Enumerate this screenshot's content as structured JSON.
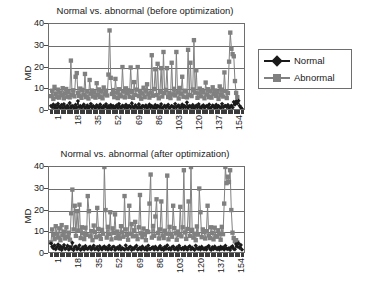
{
  "figure": {
    "background": "#ffffff",
    "axis_color": "#6e6e6e"
  },
  "legend": {
    "normal_label": "Normal",
    "abnormal_label": "Abnormal",
    "normal_color": "#1a1a1a",
    "abnormal_color": "#808080",
    "normal_marker": "diamond",
    "abnormal_marker": "square"
  },
  "panels": [
    {
      "id": "before",
      "title": "Normal vs. abnormal (before optimization)"
    },
    {
      "id": "after",
      "title": "Normal vs. abnormal (after optimization)"
    }
  ],
  "chart_data": [
    {
      "type": "line",
      "id": "before-optimization",
      "title": "Normal vs. abnormal (before optimization)",
      "xlabel": "",
      "ylabel": "MD",
      "ylim": [
        0,
        40
      ],
      "yticks": [
        0,
        10,
        20,
        30,
        40
      ],
      "xlim": [
        1,
        162
      ],
      "xticks": [
        1,
        18,
        35,
        52,
        69,
        86,
        103,
        120,
        137,
        154
      ],
      "xtick_labels": [
        "1",
        "18",
        "35",
        "52",
        "69",
        "86",
        "103",
        "120",
        "137",
        "154"
      ],
      "grid": true,
      "legend_position": "right",
      "series": [
        {
          "name": "Normal",
          "color": "#1a1a1a",
          "marker": "diamond",
          "values": [
            2.0,
            1.4,
            2.6,
            1.1,
            2.2,
            0.9,
            3.0,
            1.6,
            1.2,
            2.4,
            1.0,
            2.8,
            1.5,
            0.8,
            2.1,
            1.3,
            3.3,
            1.0,
            2.0,
            1.7,
            0.9,
            2.5,
            1.2,
            4.2,
            1.4,
            2.0,
            1.1,
            1.8,
            2.6,
            1.0,
            1.5,
            2.2,
            0.9,
            1.6,
            2.9,
            1.2,
            2.0,
            1.4,
            1.0,
            2.3,
            1.7,
            1.1,
            2.6,
            1.3,
            0.9,
            2.0,
            1.5,
            2.8,
            1.2,
            1.8,
            1.0,
            2.4,
            1.3,
            2.0,
            0.8,
            1.6,
            2.2,
            1.1,
            2.9,
            1.4,
            1.0,
            2.1,
            1.7,
            1.3,
            2.5,
            0.9,
            1.8,
            2.0,
            1.2,
            3.2,
            1.5,
            1.0,
            2.3,
            1.6,
            1.1,
            2.7,
            1.3,
            0.9,
            2.0,
            1.8,
            1.4,
            2.2,
            1.0,
            1.6,
            2.6,
            1.2,
            1.9,
            1.5,
            0.9,
            2.4,
            1.1,
            2.0,
            1.7,
            1.3,
            2.8,
            1.0,
            1.5,
            2.1,
            1.2,
            1.8,
            2.5,
            0.9,
            1.4,
            2.0,
            1.6,
            1.1,
            2.9,
            1.3,
            1.8,
            2.2,
            1.0,
            1.5,
            2.6,
            1.2,
            1.9,
            1.4,
            3.6,
            1.1,
            2.0,
            1.7,
            1.3,
            2.4,
            0.9,
            1.6,
            2.1,
            1.2,
            2.8,
            1.5,
            1.0,
            1.8,
            2.3,
            1.1,
            1.6,
            2.0,
            1.3,
            2.6,
            0.9,
            1.4,
            2.2,
            1.7,
            1.0,
            2.5,
            1.2,
            1.9,
            1.5,
            1.1,
            2.9,
            1.3,
            1.8,
            2.0,
            1.4,
            2.4,
            1.0,
            1.6,
            2.1,
            1.2,
            3.8,
            2.6,
            4.1,
            3.2,
            4.4,
            2.0,
            1.2,
            0.6
          ]
        },
        {
          "name": "Abnormal",
          "color": "#808080",
          "marker": "square",
          "values": [
            6.5,
            9.0,
            5.2,
            10.8,
            7.4,
            6.0,
            9.5,
            5.8,
            8.2,
            6.9,
            10.2,
            5.5,
            7.8,
            9.8,
            6.2,
            8.5,
            5.9,
            23.0,
            7.1,
            9.2,
            6.4,
            15.5,
            17.2,
            8.0,
            6.6,
            10.0,
            5.7,
            9.4,
            7.2,
            16.8,
            6.0,
            8.8,
            5.4,
            14.0,
            7.6,
            9.1,
            6.3,
            8.3,
            5.8,
            12.5,
            7.0,
            9.6,
            6.1,
            8.7,
            5.5,
            10.5,
            7.3,
            9.0,
            6.8,
            16.5,
            37.0,
            15.0,
            7.5,
            9.3,
            6.0,
            14.5,
            8.1,
            5.6,
            9.7,
            7.2,
            6.4,
            20.0,
            8.6,
            5.9,
            10.1,
            7.8,
            9.2,
            6.2,
            19.8,
            8.4,
            5.7,
            13.0,
            7.1,
            9.5,
            20.0,
            6.5,
            8.9,
            5.3,
            7.7,
            10.4,
            6.0,
            9.1,
            12.0,
            7.4,
            5.8,
            8.2,
            25.5,
            6.7,
            9.8,
            19.0,
            7.0,
            21.5,
            5.5,
            8.5,
            19.5,
            6.3,
            27.0,
            7.9,
            9.4,
            19.5,
            6.1,
            8.0,
            5.6,
            22.0,
            7.3,
            9.9,
            6.8,
            27.0,
            8.3,
            5.4,
            10.3,
            7.6,
            15.5,
            6.2,
            9.0,
            8.7,
            5.9,
            28.0,
            7.1,
            22.0,
            6.5,
            9.6,
            32.5,
            8.1,
            18.5,
            5.7,
            7.8,
            10.0,
            6.4,
            9.3,
            8.5,
            5.5,
            12.8,
            7.2,
            9.7,
            6.0,
            8.9,
            5.8,
            10.6,
            7.5,
            9.1,
            6.6,
            8.4,
            5.2,
            11.0,
            7.0,
            9.5,
            6.3,
            17.5,
            8.8,
            5.6,
            7.9,
            22.5,
            36.0,
            28.5,
            26.0,
            25.0,
            13.5,
            8.0,
            6.0
          ]
        }
      ]
    },
    {
      "type": "line",
      "id": "after-optimization",
      "title": "Normal vs. abnormal (after optimization)",
      "xlabel": "",
      "ylabel": "MD",
      "ylim": [
        0,
        40
      ],
      "yticks": [
        0,
        10,
        20,
        30,
        40
      ],
      "xlim": [
        1,
        162
      ],
      "xticks": [
        1,
        18,
        35,
        52,
        69,
        86,
        103,
        120,
        137,
        154
      ],
      "xtick_labels": [
        "1",
        "18",
        "35",
        "52",
        "69",
        "86",
        "103",
        "120",
        "137",
        "154"
      ],
      "grid": true,
      "legend_position": "right",
      "series": [
        {
          "name": "Normal",
          "color": "#1a1a1a",
          "marker": "diamond",
          "values": [
            4.5,
            3.0,
            2.2,
            3.6,
            1.8,
            2.8,
            4.0,
            2.0,
            3.2,
            1.5,
            2.6,
            3.8,
            1.9,
            2.4,
            3.4,
            1.6,
            2.9,
            2.1,
            4.8,
            1.4,
            2.7,
            3.1,
            1.8,
            2.3,
            3.6,
            1.5,
            2.0,
            2.8,
            1.7,
            3.3,
            2.2,
            1.9,
            2.6,
            3.0,
            1.6,
            2.4,
            3.5,
            1.8,
            2.1,
            2.9,
            1.5,
            3.2,
            2.3,
            1.7,
            2.7,
            3.1,
            1.9,
            2.5,
            1.6,
            3.4,
            2.0,
            1.8,
            2.8,
            3.0,
            1.5,
            2.2,
            2.6,
            1.9,
            3.3,
            1.7,
            2.4,
            2.0,
            1.6,
            3.6,
            2.1,
            1.8,
            2.7,
            3.0,
            1.5,
            2.3,
            1.9,
            2.8,
            3.4,
            1.7,
            2.0,
            2.5,
            1.6,
            3.1,
            2.2,
            1.8,
            2.6,
            1.5,
            3.5,
            2.0,
            1.9,
            2.4,
            2.8,
            1.6,
            3.0,
            2.1,
            1.7,
            2.5,
            3.3,
            1.8,
            2.2,
            1.5,
            2.9,
            2.0,
            3.6,
            1.9,
            2.3,
            1.6,
            2.7,
            3.1,
            1.8,
            2.0,
            2.6,
            1.5,
            3.4,
            2.2,
            1.9,
            2.4,
            1.7,
            3.0,
            2.1,
            1.6,
            2.8,
            3.2,
            1.8,
            2.5,
            2.0,
            1.5,
            3.5,
            2.3,
            1.9,
            2.6,
            1.7,
            3.0,
            2.1,
            1.8,
            2.4,
            1.6,
            2.9,
            3.3,
            2.0,
            1.5,
            2.7,
            1.9,
            3.1,
            2.2,
            1.8,
            2.5,
            1.6,
            3.0,
            2.0,
            2.6,
            1.7,
            3.4,
            2.1,
            1.9,
            2.3,
            1.5,
            2.8,
            3.2,
            2.0,
            1.8,
            4.2,
            3.0,
            4.6,
            2.5,
            3.8,
            1.6
          ]
        },
        {
          "name": "Abnormal",
          "color": "#808080",
          "marker": "square",
          "values": [
            5.0,
            11.0,
            8.5,
            6.5,
            12.5,
            9.0,
            7.2,
            11.5,
            6.0,
            13.0,
            8.2,
            10.0,
            6.8,
            12.0,
            7.5,
            9.5,
            6.2,
            18.5,
            29.5,
            11.0,
            22.0,
            8.0,
            19.5,
            10.5,
            22.5,
            7.0,
            12.0,
            9.2,
            6.5,
            11.8,
            8.5,
            26.5,
            19.5,
            7.8,
            10.2,
            6.0,
            12.8,
            9.8,
            7.4,
            21.0,
            11.2,
            8.0,
            6.6,
            10.8,
            9.0,
            41.5,
            20.0,
            7.2,
            12.2,
            8.8,
            19.0,
            6.4,
            11.5,
            9.4,
            18.0,
            7.0,
            10.0,
            8.2,
            6.8,
            12.5,
            9.6,
            7.6,
            26.5,
            11.0,
            8.4,
            6.2,
            22.0,
            9.0,
            13.5,
            7.8,
            10.6,
            14.5,
            8.0,
            6.5,
            12.0,
            27.0,
            9.2,
            7.4,
            11.4,
            8.6,
            6.0,
            10.2,
            9.8,
            23.0,
            36.5,
            7.2,
            12.6,
            8.0,
            17.0,
            25.0,
            9.4,
            6.8,
            11.0,
            24.0,
            8.2,
            7.0,
            10.4,
            9.0,
            36.0,
            6.4,
            12.2,
            8.8,
            7.6,
            22.0,
            11.6,
            9.2,
            6.2,
            10.0,
            8.4,
            21.5,
            7.8,
            12.0,
            38.5,
            9.6,
            6.6,
            11.2,
            24.0,
            8.0,
            41.0,
            10.8,
            7.2,
            9.0,
            6.0,
            12.4,
            8.6,
            30.0,
            19.0,
            7.4,
            11.0,
            9.8,
            6.8,
            10.2,
            22.0,
            8.2,
            7.0,
            12.0,
            9.4,
            6.4,
            11.8,
            8.0,
            7.6,
            10.6,
            9.0,
            6.2,
            12.2,
            8.8,
            23.0,
            41.5,
            32.5,
            35.5,
            33.0,
            38.5,
            20.0,
            9.5,
            7.0,
            5.5,
            6.0,
            5.0
          ]
        }
      ]
    }
  ]
}
